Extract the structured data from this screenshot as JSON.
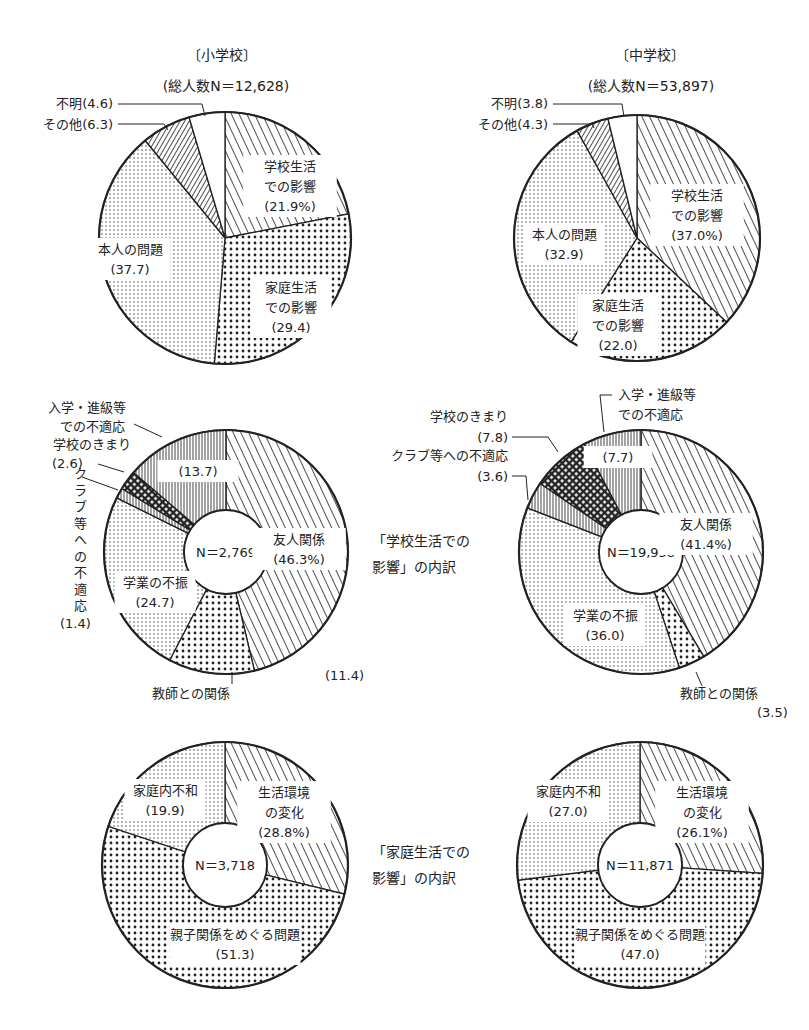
{
  "chart_data": [
    {
      "type": "pie",
      "id": "elem-total",
      "title": "〔小学校〕",
      "subtitle": "(総人数N＝12,628)",
      "center_label": "",
      "slices": [
        {
          "label": "学校生活での影響",
          "value": 21.9,
          "text": [
            "学校生活",
            "での影響",
            "(21.9%)"
          ],
          "pattern": "diag"
        },
        {
          "label": "家庭生活での影響",
          "value": 29.4,
          "text": [
            "家庭生活",
            "での影響",
            "(29.4)"
          ],
          "pattern": "dots-big"
        },
        {
          "label": "本人の問題",
          "value": 37.7,
          "text": [
            "本人の問題",
            "(37.7)"
          ],
          "pattern": "dots-small"
        },
        {
          "label": "その他",
          "value": 6.3,
          "text": [],
          "pattern": "diag-rev"
        },
        {
          "label": "不明",
          "value": 4.6,
          "text": [],
          "pattern": "blank"
        }
      ],
      "callouts": [
        {
          "text": "不明(4.6)"
        },
        {
          "text": "その他(6.3)"
        }
      ]
    },
    {
      "type": "pie",
      "id": "junior-total",
      "title": "〔中学校〕",
      "subtitle": "(総人数N＝53,897)",
      "center_label": "",
      "slices": [
        {
          "label": "学校生活での影響",
          "value": 37.0,
          "text": [
            "学校生活",
            "での影響",
            "(37.0%)"
          ],
          "pattern": "diag"
        },
        {
          "label": "家庭生活での影響",
          "value": 22.0,
          "text": [
            "家庭生活",
            "での影響",
            "(22.0)"
          ],
          "pattern": "dots-big"
        },
        {
          "label": "本人の問題",
          "value": 32.9,
          "text": [
            "本人の問題",
            "(32.9)"
          ],
          "pattern": "dots-small"
        },
        {
          "label": "その他",
          "value": 4.3,
          "text": [],
          "pattern": "diag-rev"
        },
        {
          "label": "不明",
          "value": 3.8,
          "text": [],
          "pattern": "blank"
        }
      ],
      "callouts": [
        {
          "text": "不明(3.8)"
        },
        {
          "text": "その他(4.3)"
        }
      ]
    },
    {
      "type": "pie",
      "id": "elem-school",
      "title": "",
      "center_label": "N＝2,769",
      "slices": [
        {
          "label": "友人関係",
          "value": 46.3,
          "text": [
            "友人関係",
            "(46.3%)"
          ],
          "pattern": "diag"
        },
        {
          "label": "教師との関係",
          "value": 11.4,
          "text": [],
          "pattern": "dots-big"
        },
        {
          "label": "学業の不振",
          "value": 24.7,
          "text": [
            "学業の不振",
            "(24.7)"
          ],
          "pattern": "dots-small"
        },
        {
          "label": "クラブ等への不適応",
          "value": 1.4,
          "text": [],
          "pattern": "vert"
        },
        {
          "label": "学校のきまり",
          "value": 2.6,
          "text": [],
          "pattern": "check"
        },
        {
          "label": "入学・進級等での不適応",
          "value": 13.7,
          "text": [
            "(13.7)"
          ],
          "pattern": "vert"
        }
      ],
      "callouts": [
        {
          "text": "入学・進級等"
        },
        {
          "text": "での不適応"
        },
        {
          "text": "学校のきまり"
        },
        {
          "text": "(2.6)"
        },
        {
          "text": "クラブ等への不適応"
        },
        {
          "text": "(1.4)"
        },
        {
          "text": "(11.4)"
        },
        {
          "text": "教師との関係"
        }
      ]
    },
    {
      "type": "pie",
      "id": "junior-school",
      "title": "",
      "center_label": "N＝19,958",
      "slices": [
        {
          "label": "友人関係",
          "value": 41.4,
          "text": [
            "友人関係",
            "(41.4%)"
          ],
          "pattern": "diag"
        },
        {
          "label": "教師との関係",
          "value": 3.5,
          "text": [],
          "pattern": "dots-big"
        },
        {
          "label": "学業の不振",
          "value": 36.0,
          "text": [
            "学業の不振",
            "(36.0)"
          ],
          "pattern": "dots-small"
        },
        {
          "label": "クラブ等への不適応",
          "value": 3.6,
          "text": [],
          "pattern": "vert"
        },
        {
          "label": "学校のきまり",
          "value": 7.8,
          "text": [],
          "pattern": "check"
        },
        {
          "label": "入学・進級等での不適応",
          "value": 7.7,
          "text": [
            "(7.7)"
          ],
          "pattern": "vert"
        }
      ],
      "callouts": [
        {
          "text": "入学・進級等"
        },
        {
          "text": "での不適応"
        },
        {
          "text": "学校のきまり"
        },
        {
          "text": "(7.8)"
        },
        {
          "text": "クラブ等への不適応"
        },
        {
          "text": "(3.6)"
        },
        {
          "text": "教師との関係"
        },
        {
          "text": "(3.5)"
        }
      ]
    },
    {
      "type": "pie",
      "id": "elem-home",
      "title": "",
      "center_label": "N＝3,718",
      "slices": [
        {
          "label": "生活環境の変化",
          "value": 28.8,
          "text": [
            "生活環境",
            "の変化",
            "(28.8%)"
          ],
          "pattern": "diag"
        },
        {
          "label": "親子関係をめぐる問題",
          "value": 51.3,
          "text": [
            "親子関係をめぐる問題",
            "(51.3)"
          ],
          "pattern": "dots-big"
        },
        {
          "label": "家庭内不和",
          "value": 19.9,
          "text": [
            "家庭内不和",
            "(19.9)"
          ],
          "pattern": "dots-small"
        }
      ],
      "callouts": []
    },
    {
      "type": "pie",
      "id": "junior-home",
      "title": "",
      "center_label": "N＝11,871",
      "slices": [
        {
          "label": "生活環境の変化",
          "value": 26.1,
          "text": [
            "生活環境",
            "の変化",
            "(26.1%)"
          ],
          "pattern": "diag"
        },
        {
          "label": "親子関係をめぐる問題",
          "value": 47.0,
          "text": [
            "親子関係をめぐる問題",
            "(47.0)"
          ],
          "pattern": "dots-big"
        },
        {
          "label": "家庭内不和",
          "value": 27.0,
          "text": [
            "家庭内不和",
            "(27.0)"
          ],
          "pattern": "dots-small"
        }
      ],
      "callouts": []
    }
  ],
  "side_labels": {
    "school": [
      "「学校生活での",
      "影響」の内訳"
    ],
    "home": [
      "「家庭生活での",
      "影響」の内訳"
    ]
  }
}
